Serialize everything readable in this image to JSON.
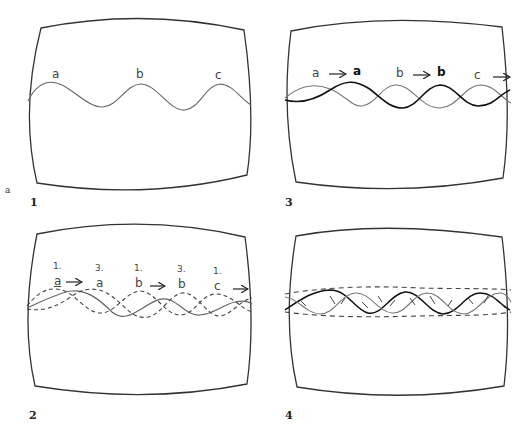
{
  "figure": {
    "side_letter": "a",
    "panels": [
      {
        "number": "1",
        "labels": [
          "a",
          "b",
          "c"
        ]
      },
      {
        "number": "3",
        "labels": [
          "a",
          "a",
          "b",
          "b",
          "c"
        ]
      },
      {
        "number": "2",
        "step_labels": [
          "1.",
          "3.",
          "1.",
          "3.",
          "1."
        ],
        "labels": [
          "a",
          "a",
          "b",
          "b",
          "c"
        ]
      },
      {
        "number": "4",
        "labels": []
      }
    ],
    "colors": {
      "outline": "#333333",
      "thin_wave": "#666666",
      "bold_wave": "#111111"
    }
  }
}
